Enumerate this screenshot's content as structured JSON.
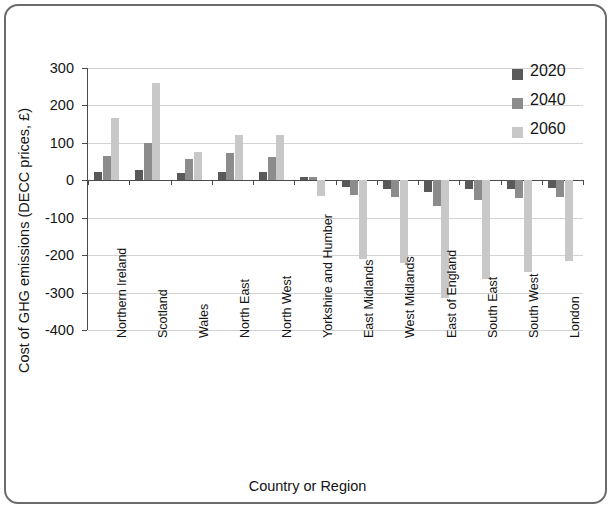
{
  "figure": {
    "frame_border_color": "#6b6b6b",
    "background": "#ffffff"
  },
  "legend": {
    "position": "top-right",
    "entries": [
      {
        "label": "2020",
        "color": "#595959"
      },
      {
        "label": "2040",
        "color": "#8c8c8c"
      },
      {
        "label": "2060",
        "color": "#c8c8c8"
      }
    ]
  },
  "axes": {
    "y_title": "Cost of GHG emissions (DECC prices, £)",
    "x_title": "Country or Region",
    "y_ticks": [
      "300",
      "200",
      "100",
      "0",
      "-100",
      "-200",
      "-300",
      "-400"
    ]
  },
  "chart_data": {
    "type": "bar",
    "title": "",
    "xlabel": "Country or Region",
    "ylabel": "Cost of GHG emissions (DECC prices, £)",
    "ylim": [
      -400,
      300
    ],
    "ytick_step": 100,
    "grid": true,
    "legend_position": "top-right",
    "categories": [
      "Northern Ireland",
      "Scotland",
      "Wales",
      "North East",
      "North West",
      "Yorkshire and Humber",
      "East Midlands",
      "West Midlands",
      "East of England",
      "South East",
      "South West",
      "London"
    ],
    "series": [
      {
        "name": "2020",
        "color": "#595959",
        "values": [
          22,
          28,
          19,
          23,
          23,
          8,
          -18,
          -22,
          -30,
          -24,
          -22,
          -20
        ]
      },
      {
        "name": "2040",
        "color": "#8c8c8c",
        "values": [
          66,
          100,
          57,
          72,
          62,
          9,
          -38,
          -45,
          -68,
          -52,
          -48,
          -44
        ]
      },
      {
        "name": "2060",
        "color": "#c8c8c8",
        "values": [
          166,
          260,
          75,
          120,
          122,
          -42,
          -210,
          -222,
          -315,
          -265,
          -245,
          -215
        ]
      }
    ]
  }
}
